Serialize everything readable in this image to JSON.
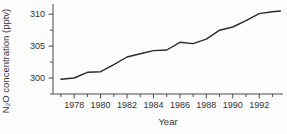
{
  "figure": {
    "background": "#fcfcfc",
    "line_color": "#2b2b2b",
    "axis_color": "#4a4a4a",
    "text_color": "#333333"
  },
  "chart_data": {
    "type": "line",
    "title": "",
    "xlabel": "Year",
    "ylabel": "N₂O concentration (pptv)",
    "series": [
      {
        "name": "N2O concentration",
        "x": [
          1977,
          1978,
          1979,
          1980,
          1981,
          1982,
          1983,
          1984,
          1985,
          1986,
          1987,
          1988,
          1989,
          1990,
          1991,
          1992,
          1993,
          1993.6
        ],
        "y": [
          299.8,
          300.0,
          300.9,
          301.0,
          302.1,
          303.3,
          303.8,
          304.3,
          304.4,
          305.6,
          305.4,
          306.1,
          307.5,
          308.0,
          309.0,
          310.1,
          310.4,
          310.5
        ]
      }
    ],
    "xlim": [
      1976.4,
      1993.8
    ],
    "ylim": [
      297.5,
      311.6
    ],
    "x_major_ticks": [
      1978,
      1980,
      1982,
      1984,
      1986,
      1988,
      1990,
      1992
    ],
    "x_major_tick_labels": [
      "1978",
      "1980",
      "1982",
      "1984",
      "1986",
      "1988",
      "1990",
      "1992"
    ],
    "x_minor_tick_step": 1,
    "y_major_ticks": [
      300,
      305,
      310
    ],
    "y_major_tick_labels": [
      "300",
      "305",
      "310"
    ],
    "y_minor_tick_step": 2.5,
    "grid": false,
    "legend": false
  }
}
